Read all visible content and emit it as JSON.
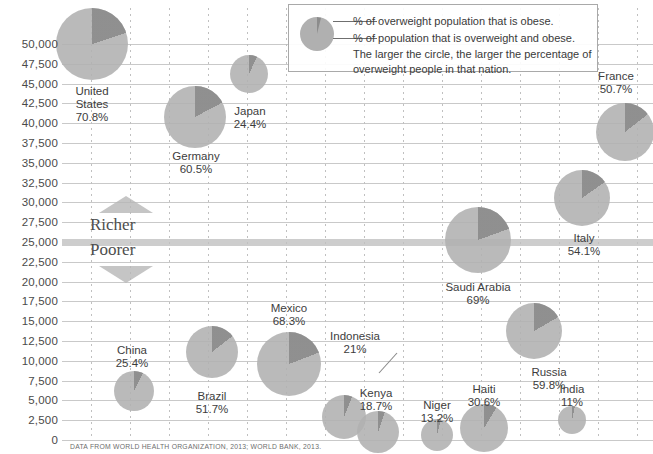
{
  "legend": {
    "line1": "% of overweight population that is obese.",
    "line2": "% of population that is overweight and obese.",
    "line3": "The larger the circle, the larger the percentage of",
    "line4": "overweight people in that nation."
  },
  "axis": {
    "y_ticks": [
      "50,000",
      "47,500",
      "45,000",
      "42,500",
      "40,000",
      "37,500",
      "35,000",
      "32,500",
      "30,000",
      "27,500",
      "25,000",
      "22,500",
      "20,000",
      "17,500",
      "15,000",
      "12,500",
      "10,000",
      "7,500",
      "5,000",
      "2,500",
      "0"
    ],
    "y_min": 0,
    "y_max": 50000,
    "y_step": 2500,
    "highlight_value": 25000
  },
  "annotations": {
    "richer": "Richer",
    "poorer": "Poorer"
  },
  "source": "DATA FROM WORLD HEALTH ORGANIZATION, 2013; WORLD BANK, 2013.",
  "colors": {
    "bubble_fill": "#b0b0b0",
    "wedge_fill": "#8c8c8c",
    "gridline": "#c9c9c9",
    "text": "#3d3d3d"
  },
  "chart_data": {
    "type": "scatter",
    "title": "",
    "xlabel": "",
    "ylabel": "GDP per capita (US$)",
    "ylim": [
      0,
      50000
    ],
    "grid": true,
    "legend_position": "top-right",
    "encoding": {
      "y": "GDP per capita",
      "size": "% of population overweight and obese",
      "wedge": "% of overweight population that is obese"
    },
    "points": [
      {
        "country": "United States",
        "label": "United States",
        "pct_overweight": 70.8,
        "pct_label": "70.8%",
        "gdp": 50000,
        "cx": 92,
        "cy": 44,
        "r": 36,
        "wedge_start": 0,
        "wedge_end": 72
      },
      {
        "country": "Germany",
        "label": "Germany",
        "pct_overweight": 60.5,
        "pct_label": "60.5%",
        "gdp": 41800,
        "cx": 195,
        "cy": 117,
        "r": 31,
        "wedge_start": 0,
        "wedge_end": 62
      },
      {
        "country": "Japan",
        "label": "Japan",
        "pct_overweight": 24.4,
        "pct_label": "24.4%",
        "gdp": 45400,
        "cx": 249,
        "cy": 74,
        "r": 19,
        "wedge_start": 0,
        "wedge_end": 25
      },
      {
        "country": "France",
        "label": "France",
        "pct_overweight": 50.7,
        "pct_label": "50.7%",
        "gdp": 39400,
        "cx": 625,
        "cy": 132,
        "r": 29,
        "wedge_start": 0,
        "wedge_end": 52
      },
      {
        "country": "Italy",
        "label": "Italy",
        "pct_overweight": 54.1,
        "pct_label": "54.1%",
        "gdp": 31800,
        "cx": 582,
        "cy": 198,
        "r": 28,
        "wedge_start": 0,
        "wedge_end": 55
      },
      {
        "country": "Saudi Arabia",
        "label": "Saudi Arabia",
        "pct_overweight": 69,
        "pct_label": "69%",
        "gdp": 25200,
        "cx": 478,
        "cy": 240,
        "r": 33,
        "wedge_start": 0,
        "wedge_end": 70
      },
      {
        "country": "Russia",
        "label": "Russia",
        "pct_overweight": 59.8,
        "pct_label": "59.8%",
        "gdp": 14600,
        "cx": 534,
        "cy": 331,
        "r": 28,
        "wedge_start": 0,
        "wedge_end": 60
      },
      {
        "country": "Mexico",
        "label": "Mexico",
        "pct_overweight": 68.3,
        "pct_label": "68.3%",
        "gdp": 10300,
        "cx": 289,
        "cy": 364,
        "r": 32,
        "wedge_start": 0,
        "wedge_end": 69
      },
      {
        "country": "Brazil",
        "label": "Brazil",
        "pct_overweight": 51.7,
        "pct_label": "51.7%",
        "gdp": 11200,
        "cx": 212,
        "cy": 352,
        "r": 26,
        "wedge_start": 0,
        "wedge_end": 52
      },
      {
        "country": "China",
        "label": "China",
        "pct_overweight": 25.4,
        "pct_label": "25.4%",
        "gdp": 6400,
        "cx": 134,
        "cy": 391,
        "r": 20,
        "wedge_start": 0,
        "wedge_end": 26
      },
      {
        "country": "Indonesia",
        "label": "Indonesia",
        "pct_overweight": 21,
        "pct_label": "21%",
        "gdp": 3400,
        "cx": 344,
        "cy": 417,
        "r": 22,
        "wedge_start": 0,
        "wedge_end": 22
      },
      {
        "country": "Kenya",
        "label": "Kenya",
        "pct_overweight": 18.7,
        "pct_label": "18.7%",
        "gdp": 1800,
        "cx": 378,
        "cy": 432,
        "r": 21,
        "wedge_start": 0,
        "wedge_end": 19
      },
      {
        "country": "Niger",
        "label": "Niger",
        "pct_overweight": 13.2,
        "pct_label": "13.2%",
        "gdp": 1500,
        "cx": 437,
        "cy": 435,
        "r": 16,
        "wedge_start": 0,
        "wedge_end": 14
      },
      {
        "country": "Haiti",
        "label": "Haiti",
        "pct_overweight": 30.6,
        "pct_label": "30.6%",
        "gdp": 2100,
        "cx": 484,
        "cy": 428,
        "r": 24,
        "wedge_start": 0,
        "wedge_end": 31
      },
      {
        "country": "India",
        "label": "India",
        "pct_overweight": 11,
        "pct_label": "11%",
        "gdp": 3000,
        "cx": 572,
        "cy": 420,
        "r": 14,
        "wedge_start": 0,
        "wedge_end": 12
      }
    ],
    "labels": [
      {
        "country": "United States",
        "x": 92,
        "y": 85,
        "lines": [
          "United",
          "States"
        ],
        "pct": "70.8%"
      },
      {
        "country": "Germany",
        "x": 196,
        "y": 150,
        "lines": [
          "Germany"
        ],
        "pct": "60.5%"
      },
      {
        "country": "Japan",
        "x": 250,
        "y": 105,
        "lines": [
          "Japan"
        ],
        "pct": "24.4%"
      },
      {
        "country": "France",
        "x": 616,
        "y": 70,
        "lines": [
          "France"
        ],
        "pct": "50.7%"
      },
      {
        "country": "Italy",
        "x": 584,
        "y": 232,
        "lines": [
          "Italy"
        ],
        "pct": "54.1%"
      },
      {
        "country": "Saudi Arabia",
        "x": 478,
        "y": 281,
        "lines": [
          "Saudi Arabia"
        ],
        "pct": "69%"
      },
      {
        "country": "Russia",
        "x": 549,
        "y": 366,
        "lines": [
          "Russia"
        ],
        "pct": "59.8%"
      },
      {
        "country": "Mexico",
        "x": 289,
        "y": 302,
        "lines": [
          "Mexico"
        ],
        "pct": "68.3%"
      },
      {
        "country": "Brazil",
        "x": 212,
        "y": 390,
        "lines": [
          "Brazil"
        ],
        "pct": "51.7%"
      },
      {
        "country": "China",
        "x": 132,
        "y": 344,
        "lines": [
          "China"
        ],
        "pct": "25.4%"
      },
      {
        "country": "Indonesia",
        "x": 355,
        "y": 330,
        "lines": [
          "Indonesia"
        ],
        "pct": "21%"
      },
      {
        "country": "Kenya",
        "x": 376,
        "y": 387,
        "lines": [
          "Kenya"
        ],
        "pct": "18.7%"
      },
      {
        "country": "Niger",
        "x": 437,
        "y": 399,
        "lines": [
          "Niger"
        ],
        "pct": "13.2%"
      },
      {
        "country": "Haiti",
        "x": 484,
        "y": 383,
        "lines": [
          "Haiti"
        ],
        "pct": "30.6%"
      },
      {
        "country": "India",
        "x": 572,
        "y": 383,
        "lines": [
          "India"
        ],
        "pct": "11%"
      }
    ]
  }
}
